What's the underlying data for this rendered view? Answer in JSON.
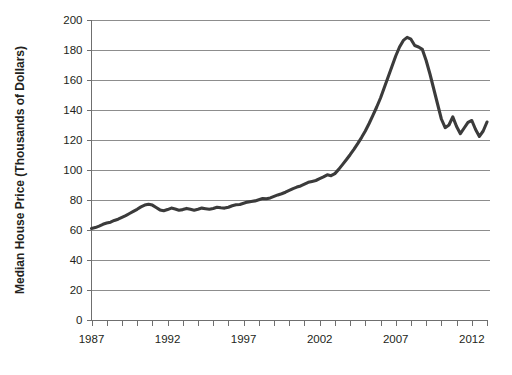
{
  "chart_data": {
    "type": "line",
    "title": "",
    "xlabel": "",
    "ylabel": "Median House Price (Thousands of Dollars)",
    "xlim": [
      1987,
      1913.0
    ],
    "ylim": [
      0,
      200
    ],
    "ytick_values": [
      0,
      20,
      40,
      60,
      80,
      100,
      120,
      140,
      160,
      180,
      200
    ],
    "ytick_labels": [
      "0",
      "20",
      "40",
      "60",
      "80",
      "100",
      "120",
      "140",
      "160",
      "180",
      "200"
    ],
    "xtick_labels": [
      "1987",
      "1992",
      "1997",
      "2002",
      "2007",
      "2012"
    ],
    "xtick_values": [
      1987,
      1992,
      1997,
      2002,
      2007,
      2012
    ],
    "x_minor_tick_step": 1,
    "x_axis_start": 1987,
    "x_axis_end": 2013,
    "grid": "horizontal",
    "legend": "none",
    "series": [
      {
        "name": "Median House Price",
        "line_color": "#3b3b3b",
        "x": [
          1987.0,
          1987.25,
          1987.5,
          1987.75,
          1988.0,
          1988.25,
          1988.5,
          1988.75,
          1989.0,
          1989.25,
          1989.5,
          1989.75,
          1990.0,
          1990.25,
          1990.5,
          1990.75,
          1991.0,
          1991.25,
          1991.5,
          1991.75,
          1992.0,
          1992.25,
          1992.5,
          1992.75,
          1993.0,
          1993.25,
          1993.5,
          1993.75,
          1994.0,
          1994.25,
          1994.5,
          1994.75,
          1995.0,
          1995.25,
          1995.5,
          1995.75,
          1996.0,
          1996.25,
          1996.5,
          1996.75,
          1997.0,
          1997.25,
          1997.5,
          1997.75,
          1998.0,
          1998.25,
          1998.5,
          1998.75,
          1999.0,
          1999.25,
          1999.5,
          1999.75,
          2000.0,
          2000.25,
          2000.5,
          2000.75,
          2001.0,
          2001.25,
          2001.5,
          2001.75,
          2002.0,
          2002.25,
          2002.5,
          2002.75,
          2003.0,
          2003.25,
          2003.5,
          2003.75,
          2004.0,
          2004.25,
          2004.5,
          2004.75,
          2005.0,
          2005.25,
          2005.5,
          2005.75,
          2006.0,
          2006.25,
          2006.5,
          2006.75,
          2007.0,
          2007.25,
          2007.5,
          2007.75,
          2008.0,
          2008.25,
          2008.5,
          2008.75,
          2009.0,
          2009.25,
          2009.5,
          2009.75,
          2010.0,
          2010.25,
          2010.5,
          2010.75,
          2011.0,
          2011.25,
          2011.5,
          2011.75,
          2012.0,
          2012.25,
          2012.5,
          2012.75,
          2013.0
        ],
        "y": [
          61.0,
          61.6,
          62.6,
          63.8,
          64.6,
          65.2,
          66.4,
          67.2,
          68.4,
          69.6,
          71.0,
          72.4,
          73.8,
          75.4,
          76.6,
          77.2,
          76.6,
          75.0,
          73.4,
          72.8,
          73.6,
          74.6,
          74.0,
          73.2,
          73.6,
          74.4,
          73.8,
          73.2,
          73.8,
          74.6,
          74.2,
          73.8,
          74.4,
          75.2,
          74.8,
          74.6,
          75.2,
          76.2,
          76.8,
          77.0,
          77.8,
          78.6,
          79.0,
          79.4,
          80.2,
          81.0,
          80.8,
          81.4,
          82.4,
          83.4,
          84.2,
          85.2,
          86.4,
          87.6,
          88.6,
          89.4,
          90.6,
          91.8,
          92.4,
          93.0,
          94.2,
          95.4,
          96.8,
          96.2,
          97.6,
          100.4,
          103.6,
          106.8,
          110.2,
          113.8,
          117.6,
          121.6,
          126.0,
          131.0,
          136.4,
          142.0,
          148.0,
          155.0,
          162.0,
          169.0,
          176.0,
          182.0,
          186.4,
          188.4,
          187.2,
          183.0,
          182.0,
          180.4,
          173.0,
          164.0,
          154.0,
          144.0,
          134.0,
          128.2,
          130.0,
          135.4,
          129.0,
          124.2,
          128.0,
          131.8,
          133.0,
          127.0,
          122.4,
          126.0,
          132.0
        ]
      }
    ]
  },
  "axis_titles": {
    "y": "Median House Price (Thousands of Dollars)"
  }
}
